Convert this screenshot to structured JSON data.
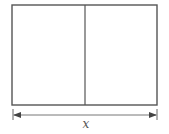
{
  "diagram": {
    "type": "rectangle-partition",
    "outer_rect": {
      "x": 12,
      "y": 5,
      "width": 145,
      "height": 100
    },
    "divider_x": 85,
    "dimension": {
      "label": "x",
      "y": 115,
      "x_start": 13,
      "x_end": 157,
      "tick_top": 109,
      "tick_bottom": 120
    },
    "colors": {
      "stroke": "#555555",
      "background": "#ffffff"
    }
  }
}
